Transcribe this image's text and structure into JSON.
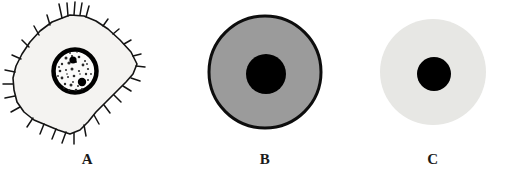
{
  "figure": {
    "background_color": "#ffffff",
    "width": 511,
    "height": 179,
    "caption": ""
  },
  "panels": [
    {
      "id": "panel-a",
      "label": "A",
      "cell_type": "spiky-cell-with-granular-nucleus",
      "description": "Irregular amoeboid cell with numerous filopodia/microvilli spikes around its outline, pale cytoplasm and a thick-rimmed granular nucleus containing two dark nucleoli",
      "cytoplasm_color": "#f4f3f1",
      "outline_color": "#141414",
      "nucleus_rim_color": "#000000",
      "nucleus_fill_color": "#fbfbfa",
      "nucleolus_color": "#000000",
      "nucleus_granularity": "speckled",
      "spike_count": 26,
      "cell_center": {
        "x": 75,
        "y": 72
      },
      "cell_radius": 62,
      "nucleus_center": {
        "x": 75,
        "y": 69
      },
      "nucleus_radius": 22
    },
    {
      "id": "panel-b",
      "label": "B",
      "cell_type": "smooth-round-cell-dark-cytoplasm",
      "description": "Smooth spherical cell with a bold black outline, uniformly medium-grey cytoplasm and a solid black round nucleus",
      "cytoplasm_color": "#9b9b9b",
      "outline_color": "#0d0d0d",
      "outline_width": 3,
      "nucleus_fill_color": "#000000",
      "cell_center": {
        "x": 90,
        "y": 70
      },
      "cell_radius": 57,
      "nucleus_center": {
        "x": 91,
        "y": 72
      },
      "nucleus_radius": 20
    },
    {
      "id": "panel-c",
      "label": "C",
      "cell_type": "smooth-round-cell-pale-cytoplasm",
      "description": "Smooth spherical cell with no visible outline, very pale grey cytoplasm and a small solid black round nucleus",
      "cytoplasm_color": "#e7e7e4",
      "outline_color": "none",
      "outline_width": 0,
      "nucleus_fill_color": "#000000",
      "cell_center": {
        "x": 78,
        "y": 70
      },
      "cell_radius": 53,
      "nucleus_center": {
        "x": 79,
        "y": 72
      },
      "nucleus_radius": 17
    }
  ]
}
